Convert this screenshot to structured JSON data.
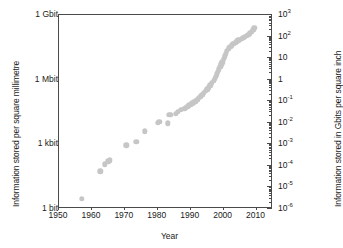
{
  "chart_data": {
    "type": "scatter",
    "title": "",
    "xlabel": "Year",
    "ylabel": "Information stored per square millimetre",
    "ylabel_right": "Information stored in Gbits per square inch",
    "xlim": [
      1950,
      2015
    ],
    "ylim_left_labels": [
      "1 bit",
      "1 kbit",
      "1 Mbit",
      "1 Gbit"
    ],
    "ylim_right": [
      1e-06,
      1000
    ],
    "grid": false,
    "legend": "none",
    "marker_color": "#c6c6c6",
    "axis_color": "#4a4a4a",
    "x_ticks": [
      "1950",
      "1960",
      "1970",
      "1980",
      "1990",
      "2000",
      "2010"
    ],
    "y_ticks_left": [
      "1 bit",
      "1 kbit",
      "1 Mbit",
      "1 Gbit"
    ],
    "y_ticks_right": [
      {
        "mantissa": "10",
        "exp": "3"
      },
      {
        "mantissa": "10",
        "exp": "2"
      },
      {
        "mantissa": "10",
        "exp": ""
      },
      {
        "mantissa": "1",
        "exp": ""
      },
      {
        "mantissa": "10",
        "exp": "-1"
      },
      {
        "mantissa": "10",
        "exp": "-2"
      },
      {
        "mantissa": "10",
        "exp": "-3"
      },
      {
        "mantissa": "10",
        "exp": "-4"
      },
      {
        "mantissa": "10",
        "exp": "-5"
      },
      {
        "mantissa": "10",
        "exp": "-6"
      }
    ],
    "series": [
      {
        "name": "Areal storage density",
        "points": [
          [
            1957,
            3e-06
          ],
          [
            1962.5,
            5.5e-05
          ],
          [
            1964,
            0.00012
          ],
          [
            1965,
            0.00016
          ],
          [
            1965.5,
            0.00018
          ],
          [
            1970.5,
            0.0009
          ],
          [
            1973.5,
            0.0013
          ],
          [
            1976,
            0.004
          ],
          [
            1980,
            0.01
          ],
          [
            1980.5,
            0.011
          ],
          [
            1983,
            0.0095
          ],
          [
            1983.5,
            0.023
          ],
          [
            1984,
            0.024
          ],
          [
            1985.5,
            0.026
          ],
          [
            1986,
            0.033
          ],
          [
            1987,
            0.04
          ],
          [
            1988,
            0.045
          ],
          [
            1988.5,
            0.05
          ],
          [
            1989,
            0.056
          ],
          [
            1989.5,
            0.065
          ],
          [
            1990,
            0.07
          ],
          [
            1990.5,
            0.08
          ],
          [
            1991,
            0.09
          ],
          [
            1991.5,
            0.1
          ],
          [
            1992,
            0.12
          ],
          [
            1992.5,
            0.14
          ],
          [
            1993,
            0.17
          ],
          [
            1993.5,
            0.2
          ],
          [
            1994,
            0.24
          ],
          [
            1994.5,
            0.3
          ],
          [
            1995,
            0.36
          ],
          [
            1995.5,
            0.45
          ],
          [
            1996,
            0.55
          ],
          [
            1996.5,
            0.7
          ],
          [
            1997,
            0.9
          ],
          [
            1997.3,
            1.1
          ],
          [
            1997.6,
            1.4
          ],
          [
            1998,
            1.8
          ],
          [
            1998.3,
            2.3
          ],
          [
            1998.6,
            3.0
          ],
          [
            1999,
            4.0
          ],
          [
            1999.3,
            5.2
          ],
          [
            1999.6,
            6.5
          ],
          [
            2000,
            9.0
          ],
          [
            2000.3,
            12
          ],
          [
            2000.6,
            16
          ],
          [
            2001,
            22
          ],
          [
            2001.5,
            28
          ],
          [
            2002,
            34
          ],
          [
            2002.5,
            40
          ],
          [
            2003,
            46
          ],
          [
            2003.5,
            52
          ],
          [
            2004,
            60
          ],
          [
            2004.5,
            66
          ],
          [
            2005,
            72
          ],
          [
            2005.5,
            80
          ],
          [
            2006,
            88
          ],
          [
            2006.5,
            96
          ],
          [
            2007,
            105
          ],
          [
            2007.5,
            120
          ],
          [
            2008,
            140
          ],
          [
            2008.5,
            170
          ],
          [
            2009,
            210
          ],
          [
            2009.3,
            250
          ]
        ]
      }
    ]
  }
}
